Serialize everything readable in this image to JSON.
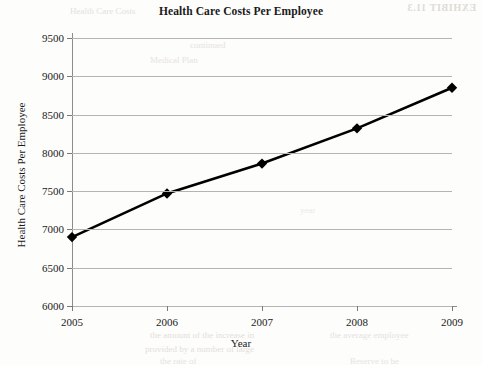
{
  "chart_data": {
    "type": "line",
    "title": "Health Care Costs Per Employee",
    "xlabel": "Year",
    "ylabel": "Health Care Costs Per Employee",
    "categories": [
      "2005",
      "2006",
      "2007",
      "2008",
      "2009"
    ],
    "values": [
      6900,
      7470,
      7860,
      8320,
      8850
    ],
    "series": [
      {
        "name": "Health Care Costs Per Employee",
        "values": [
          6900,
          7470,
          7860,
          8320,
          8850
        ]
      }
    ],
    "ylim": [
      6000,
      9500
    ],
    "ytick_step": 500,
    "yticks": [
      "6000",
      "6500",
      "7000",
      "7500",
      "8000",
      "8500",
      "9000",
      "9500"
    ],
    "xticks": [
      "2005",
      "2006",
      "2007",
      "2008",
      "2009"
    ],
    "grid": "horizontal",
    "legend": "none",
    "marker": "diamond",
    "line_color": "#000000",
    "grid_color": "#b4b4b4",
    "axis_color": "#8c8c8c",
    "background": "#fdfdfc"
  },
  "artifacts": {
    "exhibit_bleed": "EXHIBIT 11.3",
    "bleed_a": "Health Care Costs",
    "bleed_b": "continued",
    "bleed_c": "Medical Plan",
    "bleed_d": "the amount of the increase in",
    "bleed_e": "provided by  a  number of large",
    "bleed_f": "the rate of",
    "bleed_g": "the average employee",
    "bleed_h": "Reserve to be",
    "bleed_i": "year"
  }
}
